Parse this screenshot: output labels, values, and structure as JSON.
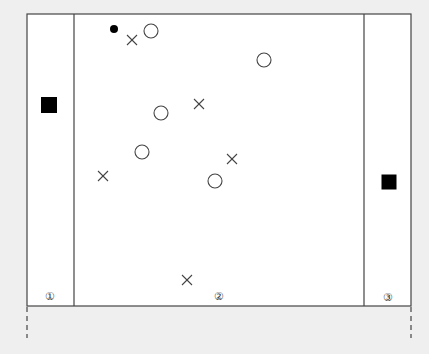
{
  "colors": {
    "background": "#efefef",
    "panel": "#ffffff",
    "stroke": "#444444",
    "fill": "#000000"
  },
  "frame": {
    "left": 27,
    "top": 14,
    "right": 411,
    "bottom": 306,
    "dividers": [
      74,
      364
    ],
    "dashed_extensions": {
      "y_start": 307,
      "y_end": 338
    }
  },
  "zones": [
    {
      "id": "zone-1",
      "label": "①",
      "label_x": 50,
      "label_y": 296
    },
    {
      "id": "zone-2",
      "label": "②",
      "label_x": 219,
      "label_y": 296
    },
    {
      "id": "zone-3",
      "label": "③",
      "label_x": 388,
      "label_y": 297
    }
  ],
  "markers": {
    "squares": [
      {
        "x": 49,
        "y": 105,
        "size": 16
      },
      {
        "x": 389,
        "y": 182,
        "size": 15
      }
    ],
    "dots": [
      {
        "x": 114,
        "y": 29,
        "r": 4
      }
    ],
    "circles": [
      {
        "x": 151,
        "y": 31,
        "r": 7
      },
      {
        "x": 264,
        "y": 60,
        "r": 7
      },
      {
        "x": 161,
        "y": 113,
        "r": 7
      },
      {
        "x": 142,
        "y": 152,
        "r": 7
      },
      {
        "x": 215,
        "y": 181,
        "r": 7
      }
    ],
    "crosses": [
      {
        "x": 132,
        "y": 40,
        "s": 5
      },
      {
        "x": 199,
        "y": 104,
        "s": 5
      },
      {
        "x": 232,
        "y": 159,
        "s": 5
      },
      {
        "x": 103,
        "y": 176,
        "s": 5
      },
      {
        "x": 187,
        "y": 280,
        "s": 5
      }
    ]
  }
}
